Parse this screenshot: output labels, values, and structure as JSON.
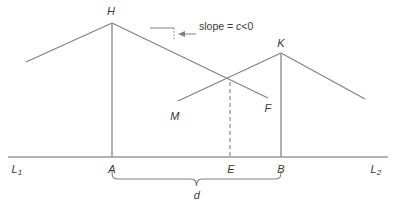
{
  "figure": {
    "type": "geometry-diagram",
    "background_color": "#ffffff",
    "line_color": "#808080",
    "text_color": "#3a3a3a",
    "width": 395,
    "height": 206,
    "annotation": {
      "slope_prefix": "slope = ",
      "slope_variable": "c",
      "slope_condition": "<0",
      "slope_full": "slope = c<0"
    },
    "labels": {
      "peak_left": "H",
      "peak_right": "K",
      "ray_left": "M",
      "ray_right": "F",
      "baseline_left": "L",
      "baseline_left_sub": "1",
      "baseline_right": "L",
      "baseline_right_sub": "2",
      "foot_left": "A",
      "foot_mid": "E",
      "foot_right": "B",
      "brace_distance": "d"
    },
    "geometry": {
      "baseline_y": 157,
      "baseline_x_start": 8,
      "baseline_x_end": 388,
      "peak_left_xy": [
        112,
        23
      ],
      "peak_right_xy": [
        281,
        53
      ],
      "left_wing_start_xy": [
        26,
        62
      ],
      "right_wing_end_xy": [
        365,
        99
      ],
      "crossing_xy": [
        230,
        82
      ],
      "ray_m_start_xy": [
        178,
        101
      ],
      "ray_f_end_xy": [
        268,
        98
      ],
      "dashed_line_x": 230,
      "brace_x_start": 112,
      "brace_x_end": 281,
      "brace_y": 176,
      "slope_triangle": [
        [
          150,
          28
        ],
        [
          174,
          28
        ],
        [
          174,
          40
        ]
      ]
    }
  }
}
